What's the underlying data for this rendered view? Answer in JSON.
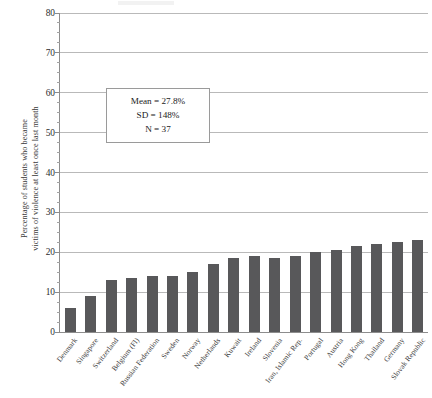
{
  "figure": {
    "y_axis_title": "Percentage of students who became\nvictims of violence at least once last month"
  },
  "annotation": {
    "mean": "Mean = 27.8%",
    "sd": "SD = 148%",
    "n": "N = 37"
  },
  "chart_data": {
    "type": "bar",
    "title": "",
    "xlabel": "",
    "ylabel": "Percentage of students who became victims of violence at least once last month",
    "ylim": [
      0,
      80
    ],
    "ytick_labels": [
      "0",
      "10",
      "20",
      "30",
      "40",
      "50",
      "60",
      "70",
      "80"
    ],
    "ytick_values": [
      0,
      10,
      20,
      30,
      40,
      50,
      60,
      70,
      80
    ],
    "minor_tick_step": 2.5,
    "grid": true,
    "legend": "none",
    "bar_color": "#58585a",
    "categories": [
      "Denmark",
      "Singapore",
      "Switzerland",
      "Belgium (Fl)",
      "Russian Federation",
      "Sweden",
      "Norway",
      "Netherlands",
      "Kuwait",
      "Ireland",
      "Slovenia",
      "Iran, Islamic Rep.",
      "Portugal",
      "Austria",
      "Hong Kong",
      "Thailand",
      "Germany",
      "Slovak Republic"
    ],
    "values": [
      6,
      9,
      13,
      13.5,
      14,
      14,
      15,
      17,
      18.5,
      19,
      18.5,
      19,
      20,
      20.5,
      21.5,
      22,
      22.5,
      23
    ],
    "annotations": [
      "Mean = 27.8%",
      "SD = 148%",
      "N = 37"
    ]
  }
}
